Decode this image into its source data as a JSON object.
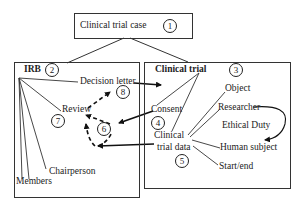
{
  "diagram": {
    "root": {
      "label": "Clinical trial case",
      "number": "1"
    },
    "irb": {
      "label": "IRB",
      "number": "2",
      "children": [
        "Decision letter",
        "Review",
        "Chairperson",
        "Members"
      ],
      "decision_letter": {
        "label": "Decision letter",
        "number": "8"
      },
      "review": {
        "label": "Review",
        "number": "7"
      },
      "chairperson": "Chairperson",
      "members": "Members",
      "dashed_node_number": "6"
    },
    "clinical_trial": {
      "label": "Clinical trial",
      "number": "3",
      "consent": {
        "label": "Consent",
        "number": "4"
      },
      "clinical_trial_data": {
        "label_line1": "Clinical",
        "label_line2": "trial data",
        "number": "5"
      },
      "data_children": [
        "Object",
        "Researcher",
        "Human subject",
        "Start/end"
      ],
      "object": "Object",
      "researcher": "Researcher",
      "ethical_duty": "Ethical Duty",
      "human_subject": "Human subject",
      "start_end": "Start/end"
    },
    "edges": [
      {
        "from": "Clinical trial case",
        "to": "IRB",
        "style": "solid"
      },
      {
        "from": "Clinical trial case",
        "to": "Clinical trial",
        "style": "solid"
      },
      {
        "from": "Decision letter",
        "to": "Clinical trial",
        "style": "arrow"
      },
      {
        "from": "Consent",
        "to": "6",
        "style": "arrow"
      },
      {
        "from": "Clinical trial data",
        "to": "6",
        "style": "arrow"
      },
      {
        "from": "6",
        "to": "Review",
        "style": "dashed-arrow"
      },
      {
        "from": "Review",
        "to": "Decision letter",
        "style": "dashed-arrow"
      },
      {
        "from": "Researcher",
        "to": "Human subject",
        "style": "curved-arrow",
        "label": "Ethical Duty"
      }
    ]
  }
}
